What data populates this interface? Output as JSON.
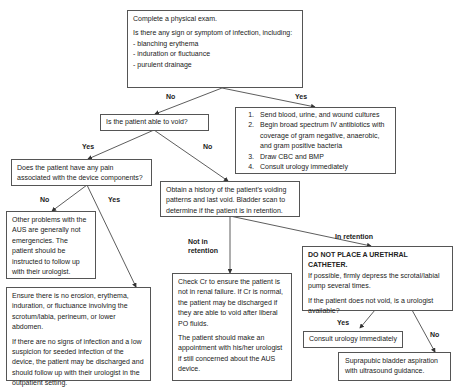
{
  "nodes": {
    "exam": {
      "line1": "Complete a physical exam.",
      "line2": "Is there any sign or symptom of infection, including:",
      "bullets": [
        "-  blanching erythema",
        "-  induration or   fluctuance",
        "-  purulent drainage"
      ]
    },
    "infection_actions": {
      "items": [
        "Send blood, urine, and wound cultures",
        "Begin broad spectrum IV antibiotics with coverage of gram negative, anaerobic, and gram positive bacteria",
        "Draw CBC and BMP",
        "Consult urology immediately"
      ]
    },
    "void_question": {
      "text": "Is the patient able to void?"
    },
    "pain_question": {
      "text": "Does the patient have any pain associated with the device components?"
    },
    "other_problems": {
      "text": "Other problems with the AUS are generally not emergencies. The patient should be instructed to follow up with their urologist."
    },
    "ensure_no_erosion": {
      "p1": "Ensure there is no erosion, erythema, induration, or   fluctuance  involving the scrotum/labia, perineum, or lower abdomen.",
      "p2": "If there are no signs of infection and a low suspicion for seeded infection of the device, the patient may be discharged and should follow up with their urologist in the outpatient setting."
    },
    "history": {
      "text": "Obtain a  history of the patient's voiding patterns and last void.   Bladder scan to determine if the patient is in retention."
    },
    "check_cr": {
      "p1": "Check Cr to ensure the patient is not in renal failure. If Cr is normal, the patient may be discharged if they are able to void after liberal PO fluids.",
      "p2": "The patient should make an appointment with his/her urologist if still concerned about the AUS device."
    },
    "in_retention": {
      "heading": "DO NOT PLACE A URETHRAL CATHETER.",
      "p1": "If possible, firmly depress the scrotal/labial pump several times.",
      "p2": "If the patient does not void, is a urologist available?"
    },
    "consult_urology": {
      "text": "Consult urology immediately"
    },
    "suprapubic": {
      "text": "Suprapubic bladder aspiration with ultrasound guidance."
    }
  },
  "edge_labels": {
    "exam_no": "No",
    "exam_yes": "Yes",
    "void_yes": "Yes",
    "void_no": "No",
    "pain_no": "No",
    "pain_yes": "Yes",
    "not_in_retention": "Not in retention",
    "in_retention": "In retention",
    "urologist_yes": "Yes",
    "urologist_no": "No"
  },
  "colors": {
    "line": "#333333",
    "border": "#555555",
    "text": "#222222"
  }
}
